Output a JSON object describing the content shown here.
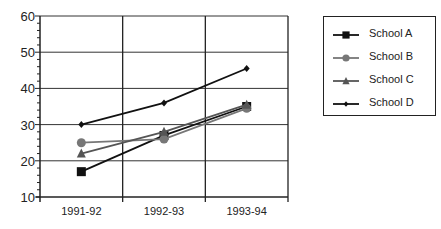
{
  "chart_data": {
    "type": "line",
    "title": "",
    "xlabel": "",
    "ylabel": "",
    "categories": [
      "1991-92",
      "1992-93",
      "1993-94"
    ],
    "y_ticks": [
      10,
      20,
      30,
      40,
      50,
      60
    ],
    "ylim": [
      10,
      60
    ],
    "grid": true,
    "legend_position": "right",
    "series": [
      {
        "name": "School A",
        "marker": "square",
        "color": "#111111",
        "values": [
          17,
          27,
          35
        ]
      },
      {
        "name": "School B",
        "marker": "circle",
        "color": "#777777",
        "values": [
          25,
          26,
          34.5
        ]
      },
      {
        "name": "School C",
        "marker": "triangle",
        "color": "#555555",
        "values": [
          22,
          28,
          35.5
        ]
      },
      {
        "name": "School D",
        "marker": "diamond",
        "color": "#111111",
        "values": [
          30,
          36,
          45.5
        ]
      }
    ]
  },
  "legend": {
    "items": [
      {
        "label": "School A"
      },
      {
        "label": "School B"
      },
      {
        "label": "School C"
      },
      {
        "label": "School D"
      }
    ]
  }
}
